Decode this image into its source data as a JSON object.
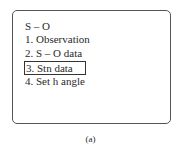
{
  "menu": {
    "title": "S – O",
    "items": [
      {
        "label": "1. Observation",
        "selected": false
      },
      {
        "label": "2. S – O data",
        "selected": false
      },
      {
        "label": "3. Stn data",
        "selected": true
      },
      {
        "label": "4. Set h angle",
        "selected": false
      }
    ]
  },
  "caption": "(a)"
}
